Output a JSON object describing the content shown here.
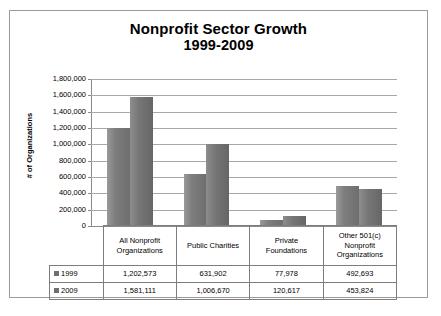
{
  "chart_data": {
    "type": "bar",
    "title": "Nonprofit  Sector Growth 1999-2009",
    "title_line1": "Nonprofit  Sector Growth",
    "title_line2": "1999-2009",
    "xlabel": "",
    "ylabel": "# of Organizations",
    "ylim": [
      0,
      1800000
    ],
    "ytick_step": 200000,
    "grid": true,
    "legend_position": "table-below",
    "categories": [
      "All Nonprofit Organizations",
      "Public Charities",
      "Private Foundations",
      "Other 501(c) Nonprofit Organizations"
    ],
    "category_lines": [
      [
        "All Nonprofit",
        "Organizations"
      ],
      [
        "Public Charities"
      ],
      [
        "Private",
        "Foundations"
      ],
      [
        "Other 501(c)",
        "Nonprofit",
        "Organizations"
      ]
    ],
    "series": [
      {
        "name": "1999",
        "values": [
          1202573,
          631902,
          77978,
          492693
        ],
        "labels": [
          "1,202,573",
          "631,902",
          "77,978",
          "492,693"
        ],
        "color": "#757575"
      },
      {
        "name": "2009",
        "values": [
          1581111,
          1006670,
          120617,
          453824
        ],
        "labels": [
          "1,581,111",
          "1,006,670",
          "120,617",
          "453,824"
        ],
        "color": "#6e6e6e"
      }
    ],
    "ytick_labels": [
      "1,800,000",
      "1,600,000",
      "1,400,000",
      "1,200,000",
      "1,000,000",
      "800,000",
      "600,000",
      "400,000",
      "200,000",
      "0"
    ],
    "ytick_values": [
      1800000,
      1600000,
      1400000,
      1200000,
      1000000,
      800000,
      600000,
      400000,
      200000,
      0
    ]
  }
}
